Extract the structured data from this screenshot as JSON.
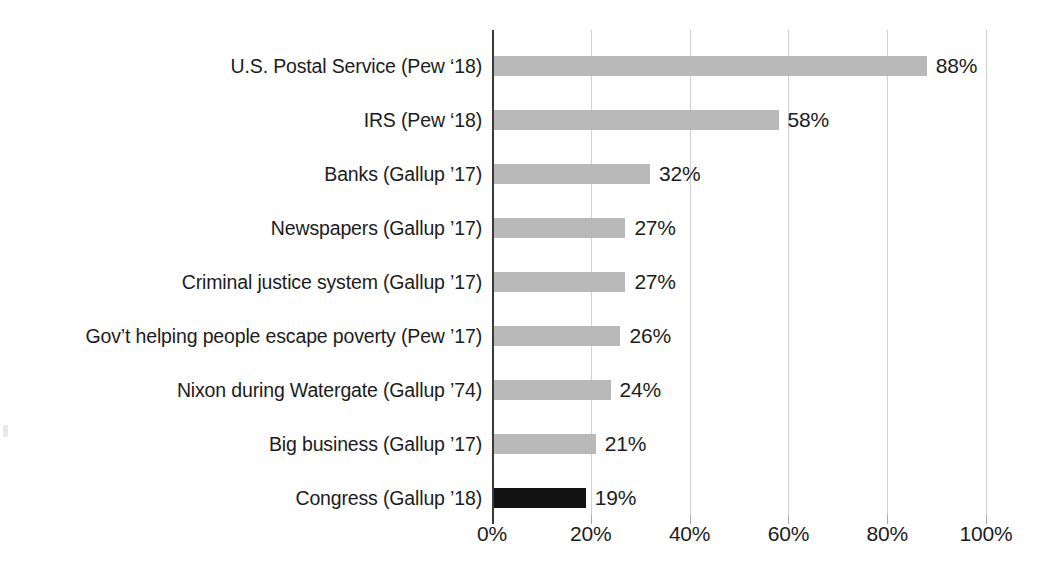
{
  "chart_data": {
    "type": "bar",
    "orientation": "horizontal",
    "title": "",
    "xlabel": "",
    "ylabel": "",
    "xlim": [
      0,
      100
    ],
    "grid": true,
    "legend": "none",
    "value_suffix": "%",
    "categories": [
      "U.S. Postal Service (Pew ‘18)",
      "IRS (Pew ‘18)",
      "Banks (Gallup ’17)",
      "Newspapers (Gallup ’17)",
      "Criminal justice system (Gallup ’17)",
      "Gov’t helping people escape poverty (Pew ’17)",
      "Nixon during Watergate (Gallup ’74)",
      "Big business (Gallup ’17)",
      "Congress (Gallup ’18)"
    ],
    "values": [
      88,
      58,
      32,
      27,
      27,
      26,
      24,
      21,
      19
    ],
    "value_labels": [
      "88%",
      "58%",
      "32%",
      "27%",
      "27%",
      "26%",
      "24%",
      "21%",
      "19%"
    ],
    "highlighted": [
      false,
      false,
      false,
      false,
      false,
      false,
      false,
      false,
      true
    ],
    "xticks": [
      0,
      20,
      40,
      60,
      80,
      100
    ],
    "xtick_labels": [
      "0%",
      "20%",
      "40%",
      "60%",
      "80%",
      "100%"
    ]
  },
  "colors": {
    "bar": "#b9b9b9",
    "bar_highlight": "#121212",
    "gridline": "#cfcfcf",
    "axis": "#3a3a3a",
    "text": "#1c1c1c",
    "background": "#ffffff"
  }
}
